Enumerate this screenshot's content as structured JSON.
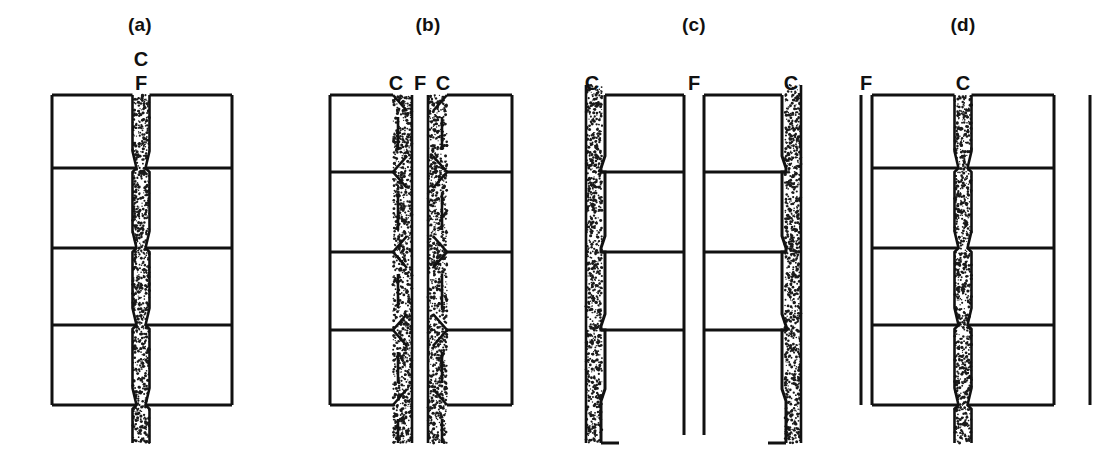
{
  "figure": {
    "background_color": "#ffffff",
    "ink_color": "#111111",
    "stipple_color": "#1a1a1a",
    "width": 1115,
    "height": 461
  },
  "panels": [
    {
      "id": "a",
      "label": "(a)",
      "label_x": 140,
      "label_y": 31,
      "annotations": [
        {
          "text": "C",
          "x": 141,
          "y": 66,
          "name": "label-c"
        },
        {
          "text": "F",
          "x": 141,
          "y": 90,
          "name": "label-f"
        }
      ],
      "box_left": 52,
      "box_right": 232,
      "box_top": 95,
      "box_bottom": 405,
      "dividers": [
        168,
        248,
        325
      ],
      "channel_center": 141,
      "channel_wide": 17,
      "channel_narrow": 9,
      "channel_tail_bottom": 443,
      "description": "Single central stippled channel with pinch points at each divider; channel continues below the lower boundary"
    },
    {
      "id": "b",
      "label": "(b)",
      "label_x": 428,
      "label_y": 31,
      "annotations": [
        {
          "text": "C",
          "x": 396,
          "y": 90,
          "name": "label-c-left"
        },
        {
          "text": "F",
          "x": 420,
          "y": 90,
          "name": "label-f"
        },
        {
          "text": "C",
          "x": 443,
          "y": 90,
          "name": "label-c-right"
        }
      ],
      "box_left": 330,
      "box_right": 512,
      "box_top": 95,
      "box_bottom": 405,
      "dividers": [
        172,
        252,
        330
      ],
      "band_left_x": 393,
      "band_right_x": 428,
      "band_width": 19,
      "fracture_x": 421,
      "channel_tail_bottom": 443,
      "description": "Two stippled bands flanking a central fracture plane; chevron notches point inward at every divider level"
    },
    {
      "id": "c",
      "label": "(c)",
      "label_x": 694,
      "label_y": 31,
      "annotations": [
        {
          "text": "C",
          "x": 592,
          "y": 90,
          "name": "label-c-left"
        },
        {
          "text": "F",
          "x": 694,
          "y": 90,
          "name": "label-f"
        },
        {
          "text": "C",
          "x": 791,
          "y": 90,
          "name": "label-c-right"
        }
      ],
      "box_left": 605,
      "box_right": 782,
      "box_top": 95,
      "box_bottom": 405,
      "dividers": [
        172,
        252,
        330
      ],
      "band_left_x": 586,
      "band_right_x": 785,
      "band_width": 16,
      "fracture_x": 694,
      "description": "Stippled bands on the outer edges; the central fracture F separates two free-standing halves"
    },
    {
      "id": "d",
      "label": "(d)",
      "label_x": 963,
      "label_y": 31,
      "annotations": [
        {
          "text": "F",
          "x": 866,
          "y": 90,
          "name": "label-f"
        },
        {
          "text": "C",
          "x": 963,
          "y": 90,
          "name": "label-c"
        }
      ],
      "box_left": 872,
      "box_right": 1054,
      "box_top": 95,
      "box_bottom": 405,
      "dividers": [
        168,
        248,
        325
      ],
      "channel_center": 963,
      "channel_wide": 17,
      "channel_narrow": 9,
      "channel_tail_bottom": 443,
      "fracture_lines_x": [
        861,
        1090
      ],
      "fracture_top": 95,
      "fracture_bottom": 405,
      "description": "Central stippled channel as in (a), bounded by two external vertical fracture traces F"
    }
  ]
}
